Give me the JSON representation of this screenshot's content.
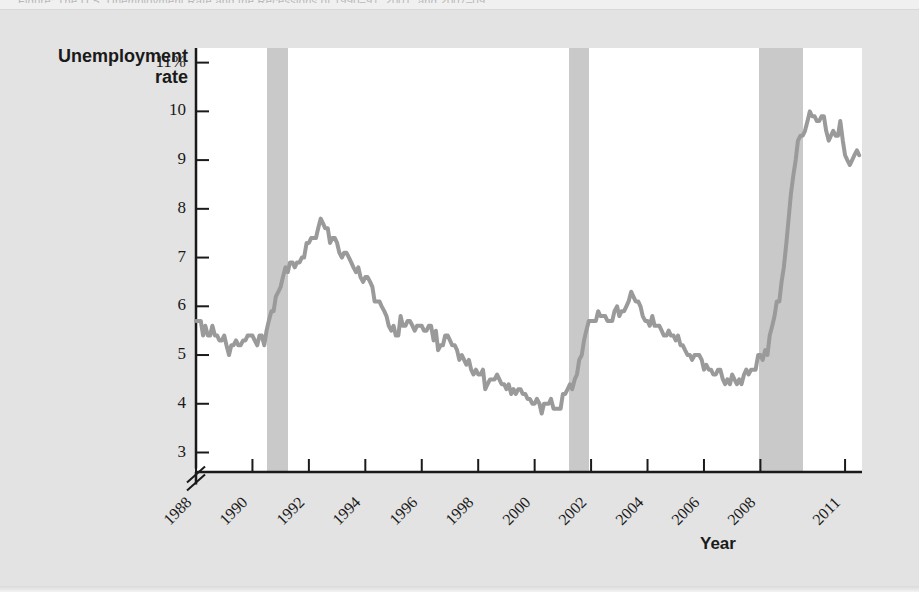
{
  "figure": {
    "top_strip_text": "Figure: The U.S. Unemployment Rate and the Recessions of 1990–91, 2001, and 2007–09",
    "background_color": "#e3e3e3",
    "plot_background_color": "#ffffff"
  },
  "chart_data": {
    "type": "line",
    "title": "",
    "subtitle": "",
    "xlabel": "Year",
    "ylabel": "Unemployment rate",
    "ylabel_lines": [
      "Unemployment",
      "rate"
    ],
    "ylim": [
      2.6,
      11.3
    ],
    "y_axis_break": true,
    "y_axis_break_below": 3,
    "grid": false,
    "legend": "none",
    "line_color": "#9a9a9a",
    "line_width_px": 4,
    "recession_band_color": "#c9c9c9",
    "ytick_labels": [
      "11%",
      "10",
      "9",
      "8",
      "7",
      "6",
      "5",
      "4",
      "3"
    ],
    "ytick_values": [
      11,
      10,
      9,
      8,
      7,
      6,
      5,
      4,
      3
    ],
    "xtick_labels": [
      "1988",
      "1990",
      "1992",
      "1994",
      "1996",
      "1998",
      "2000",
      "2002",
      "2004",
      "2006",
      "2008",
      "2011"
    ],
    "xtick_values": [
      1988,
      1990,
      1992,
      1994,
      1996,
      1998,
      2000,
      2002,
      2004,
      2006,
      2008,
      2011
    ],
    "xlim": [
      1988.0,
      2011.6
    ],
    "annotations": [],
    "recessions": [
      {
        "name": "1990-91 recession",
        "start": 1990.5,
        "end": 1991.25
      },
      {
        "name": "2001 recession",
        "start": 2001.2,
        "end": 2001.92
      },
      {
        "name": "2007-09 recession",
        "start": 2007.95,
        "end": 2009.5
      }
    ],
    "series": [
      {
        "name": "U.S. unemployment rate",
        "x": [
          1988.0,
          1988.08,
          1988.17,
          1988.25,
          1988.33,
          1988.42,
          1988.5,
          1988.58,
          1988.67,
          1988.75,
          1988.83,
          1988.92,
          1989.0,
          1989.08,
          1989.17,
          1989.25,
          1989.33,
          1989.42,
          1989.5,
          1989.58,
          1989.67,
          1989.75,
          1989.83,
          1989.92,
          1990.0,
          1990.08,
          1990.17,
          1990.25,
          1990.33,
          1990.42,
          1990.5,
          1990.58,
          1990.67,
          1990.75,
          1990.83,
          1990.92,
          1991.0,
          1991.08,
          1991.17,
          1991.25,
          1991.33,
          1991.42,
          1991.5,
          1991.58,
          1991.67,
          1991.75,
          1991.83,
          1991.92,
          1992.0,
          1992.08,
          1992.17,
          1992.25,
          1992.33,
          1992.42,
          1992.5,
          1992.58,
          1992.67,
          1992.75,
          1992.83,
          1992.92,
          1993.0,
          1993.08,
          1993.17,
          1993.25,
          1993.33,
          1993.42,
          1993.5,
          1993.58,
          1993.67,
          1993.75,
          1993.83,
          1993.92,
          1994.0,
          1994.08,
          1994.17,
          1994.25,
          1994.33,
          1994.42,
          1994.5,
          1994.58,
          1994.67,
          1994.75,
          1994.83,
          1994.92,
          1995.0,
          1995.08,
          1995.17,
          1995.25,
          1995.33,
          1995.42,
          1995.5,
          1995.58,
          1995.67,
          1995.75,
          1995.83,
          1995.92,
          1996.0,
          1996.08,
          1996.17,
          1996.25,
          1996.33,
          1996.42,
          1996.5,
          1996.58,
          1996.67,
          1996.75,
          1996.83,
          1996.92,
          1997.0,
          1997.08,
          1997.17,
          1997.25,
          1997.33,
          1997.42,
          1997.5,
          1997.58,
          1997.67,
          1997.75,
          1997.83,
          1997.92,
          1998.0,
          1998.08,
          1998.17,
          1998.25,
          1998.33,
          1998.42,
          1998.5,
          1998.58,
          1998.67,
          1998.75,
          1998.83,
          1998.92,
          1999.0,
          1999.08,
          1999.17,
          1999.25,
          1999.33,
          1999.42,
          1999.5,
          1999.58,
          1999.67,
          1999.75,
          1999.83,
          1999.92,
          2000.0,
          2000.08,
          2000.17,
          2000.25,
          2000.33,
          2000.42,
          2000.5,
          2000.58,
          2000.67,
          2000.75,
          2000.83,
          2000.92,
          2001.0,
          2001.08,
          2001.17,
          2001.25,
          2001.33,
          2001.42,
          2001.5,
          2001.58,
          2001.67,
          2001.75,
          2001.83,
          2001.92,
          2002.0,
          2002.08,
          2002.17,
          2002.25,
          2002.33,
          2002.42,
          2002.5,
          2002.58,
          2002.67,
          2002.75,
          2002.83,
          2002.92,
          2003.0,
          2003.08,
          2003.17,
          2003.25,
          2003.33,
          2003.42,
          2003.5,
          2003.58,
          2003.67,
          2003.75,
          2003.83,
          2003.92,
          2004.0,
          2004.08,
          2004.17,
          2004.25,
          2004.33,
          2004.42,
          2004.5,
          2004.58,
          2004.67,
          2004.75,
          2004.83,
          2004.92,
          2005.0,
          2005.08,
          2005.17,
          2005.25,
          2005.33,
          2005.42,
          2005.5,
          2005.58,
          2005.67,
          2005.75,
          2005.83,
          2005.92,
          2006.0,
          2006.08,
          2006.17,
          2006.25,
          2006.33,
          2006.42,
          2006.5,
          2006.58,
          2006.67,
          2006.75,
          2006.83,
          2006.92,
          2007.0,
          2007.08,
          2007.17,
          2007.25,
          2007.33,
          2007.42,
          2007.5,
          2007.58,
          2007.67,
          2007.75,
          2007.83,
          2007.92,
          2008.0,
          2008.08,
          2008.17,
          2008.25,
          2008.33,
          2008.42,
          2008.5,
          2008.58,
          2008.67,
          2008.75,
          2008.83,
          2008.92,
          2009.0,
          2009.08,
          2009.17,
          2009.25,
          2009.33,
          2009.42,
          2009.5,
          2009.58,
          2009.67,
          2009.75,
          2009.83,
          2009.92,
          2010.0,
          2010.08,
          2010.17,
          2010.25,
          2010.33,
          2010.42,
          2010.5,
          2010.58,
          2010.67,
          2010.75,
          2010.83,
          2010.92,
          2011.0,
          2011.08,
          2011.17,
          2011.25,
          2011.33,
          2011.42,
          2011.5
        ],
        "values": [
          5.7,
          5.7,
          5.7,
          5.4,
          5.6,
          5.4,
          5.4,
          5.6,
          5.4,
          5.4,
          5.3,
          5.3,
          5.4,
          5.2,
          5.0,
          5.2,
          5.2,
          5.3,
          5.2,
          5.2,
          5.3,
          5.3,
          5.4,
          5.4,
          5.4,
          5.3,
          5.2,
          5.4,
          5.4,
          5.2,
          5.5,
          5.7,
          5.9,
          5.9,
          6.2,
          6.3,
          6.4,
          6.6,
          6.8,
          6.7,
          6.9,
          6.9,
          6.8,
          6.9,
          6.9,
          7.0,
          7.0,
          7.3,
          7.3,
          7.4,
          7.4,
          7.4,
          7.6,
          7.8,
          7.7,
          7.6,
          7.6,
          7.3,
          7.4,
          7.4,
          7.3,
          7.1,
          7.0,
          7.1,
          7.1,
          7.0,
          6.9,
          6.8,
          6.7,
          6.8,
          6.6,
          6.5,
          6.6,
          6.6,
          6.5,
          6.4,
          6.1,
          6.1,
          6.1,
          6.0,
          5.9,
          5.8,
          5.6,
          5.5,
          5.6,
          5.4,
          5.4,
          5.8,
          5.6,
          5.6,
          5.7,
          5.7,
          5.6,
          5.5,
          5.6,
          5.6,
          5.6,
          5.5,
          5.5,
          5.6,
          5.6,
          5.3,
          5.5,
          5.1,
          5.2,
          5.2,
          5.4,
          5.4,
          5.3,
          5.2,
          5.2,
          5.1,
          4.9,
          5.0,
          4.9,
          4.8,
          4.9,
          4.7,
          4.6,
          4.7,
          4.6,
          4.6,
          4.7,
          4.3,
          4.4,
          4.5,
          4.5,
          4.5,
          4.6,
          4.5,
          4.4,
          4.4,
          4.3,
          4.4,
          4.2,
          4.3,
          4.2,
          4.3,
          4.3,
          4.2,
          4.2,
          4.1,
          4.1,
          4.0,
          4.0,
          4.1,
          4.0,
          3.8,
          4.0,
          4.0,
          4.0,
          4.1,
          3.9,
          3.9,
          3.9,
          3.9,
          4.2,
          4.2,
          4.3,
          4.4,
          4.3,
          4.5,
          4.6,
          4.9,
          5.0,
          5.3,
          5.5,
          5.7,
          5.7,
          5.7,
          5.7,
          5.9,
          5.8,
          5.8,
          5.8,
          5.7,
          5.7,
          5.7,
          5.9,
          6.0,
          5.8,
          5.9,
          5.9,
          6.0,
          6.1,
          6.3,
          6.2,
          6.1,
          6.1,
          6.0,
          5.8,
          5.7,
          5.7,
          5.6,
          5.8,
          5.6,
          5.6,
          5.6,
          5.5,
          5.4,
          5.4,
          5.5,
          5.4,
          5.4,
          5.3,
          5.4,
          5.2,
          5.2,
          5.1,
          5.0,
          5.0,
          4.9,
          5.0,
          5.0,
          5.0,
          4.9,
          4.7,
          4.8,
          4.7,
          4.7,
          4.6,
          4.6,
          4.7,
          4.7,
          4.5,
          4.4,
          4.5,
          4.4,
          4.6,
          4.5,
          4.4,
          4.5,
          4.4,
          4.6,
          4.7,
          4.6,
          4.7,
          4.7,
          4.7,
          5.0,
          5.0,
          4.9,
          5.1,
          5.0,
          5.4,
          5.6,
          5.8,
          6.1,
          6.1,
          6.5,
          6.8,
          7.3,
          7.8,
          8.3,
          8.7,
          9.0,
          9.4,
          9.5,
          9.5,
          9.6,
          9.8,
          10.0,
          9.9,
          9.9,
          9.8,
          9.8,
          9.9,
          9.9,
          9.6,
          9.4,
          9.5,
          9.6,
          9.5,
          9.5,
          9.8,
          9.4,
          9.1,
          9.0,
          8.9,
          9.0,
          9.1,
          9.2,
          9.1
        ]
      }
    ]
  },
  "axis_geometry": {
    "plot_left_px": 196,
    "plot_top_px": 48,
    "plot_width_px": 666,
    "plot_height_px": 424,
    "y_baseline_px": 472,
    "y_top_value": 11.3,
    "y_bottom_value": 2.6
  }
}
